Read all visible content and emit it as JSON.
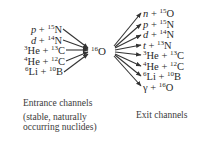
{
  "diagram": {
    "compound_nucleus": {
      "mass": "16",
      "symbol": "O"
    },
    "entrance_channels": [
      {
        "particle": "p",
        "italic": true,
        "target_mass": "15",
        "target": "N"
      },
      {
        "particle": "d",
        "italic": true,
        "target_mass": "14",
        "target": "N"
      },
      {
        "particle_mass": "3",
        "particle": "He",
        "italic": false,
        "target_mass": "13",
        "target": "C"
      },
      {
        "particle_mass": "4",
        "particle": "He",
        "italic": false,
        "target_mass": "12",
        "target": "C"
      },
      {
        "particle_mass": "6",
        "particle": "Li",
        "italic": false,
        "target_mass": "10",
        "target": "B"
      }
    ],
    "exit_channels": [
      {
        "particle": "n",
        "italic": true,
        "target_mass": "15",
        "target": "O"
      },
      {
        "particle": "p",
        "italic": true,
        "target_mass": "15",
        "target": "N"
      },
      {
        "particle": "d",
        "italic": true,
        "target_mass": "14",
        "target": "N"
      },
      {
        "particle": "t",
        "italic": true,
        "target_mass": "13",
        "target": "N"
      },
      {
        "particle_mass": "3",
        "particle": "He",
        "italic": false,
        "target_mass": "13",
        "target": "C"
      },
      {
        "particle_mass": "4",
        "particle": "He",
        "italic": false,
        "target_mass": "12",
        "target": "C"
      },
      {
        "particle_mass": "6",
        "particle": "Li",
        "italic": false,
        "target_mass": "10",
        "target": "B"
      },
      {
        "particle": "γ",
        "italic": false,
        "target_mass": "16",
        "target": "O"
      }
    ],
    "plus": "+",
    "captions": {
      "entrance_title": "Entrance channels",
      "entrance_note_line1": "(stable, naturally",
      "entrance_note_line2": "occurring nuclides)",
      "exit_title": "Exit channels"
    },
    "colors": {
      "text": "#2a2a2a",
      "arrow": "#333333"
    }
  }
}
